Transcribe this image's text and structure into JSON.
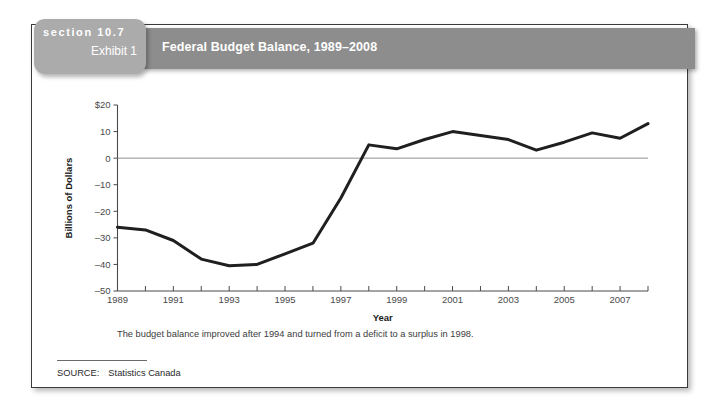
{
  "card": {
    "section_label": "section 10.7",
    "exhibit_label": "Exhibit 1",
    "banner_title": "Federal Budget Balance, 1989–2008",
    "caption": "The budget balance improved after 1994 and turned from a deficit to a surplus in 1998.",
    "source_label": "SOURCE:",
    "source_value": "Statistics Canada"
  },
  "colors": {
    "banner": "#8d8d8d",
    "section_tab": "#ababab",
    "line": "#1f1f1f",
    "axis": "#4a4a4a",
    "zero_line": "#8f8f8f",
    "card_border": "#3a3a3a"
  },
  "chart_data": {
    "type": "line",
    "title": "Federal Budget Balance, 1989–2008",
    "xlabel": "Year",
    "ylabel": "Billions of Dollars",
    "xlim": [
      1989,
      2008
    ],
    "ylim": [
      -50,
      20
    ],
    "ytick_values": [
      20,
      10,
      0,
      -10,
      -20,
      -30,
      -40,
      -50
    ],
    "ytick_labels": [
      "$20",
      "10",
      "0",
      "–10",
      "–20",
      "–30",
      "–40",
      "–50"
    ],
    "xtick_values": [
      1989,
      1990,
      1991,
      1992,
      1993,
      1994,
      1995,
      1996,
      1997,
      1998,
      1999,
      2000,
      2001,
      2002,
      2003,
      2004,
      2005,
      2006,
      2007,
      2008
    ],
    "xtick_labels": [
      "1989",
      "",
      "1991",
      "",
      "1993",
      "",
      "1995",
      "",
      "1997",
      "",
      "1999",
      "",
      "2001",
      "",
      "2003",
      "",
      "2005",
      "",
      "2007",
      ""
    ],
    "grid": false,
    "legend": "none",
    "zero_reference_line": 0,
    "series": [
      {
        "name": "Federal Budget Balance",
        "x": [
          1989,
          1990,
          1991,
          1992,
          1993,
          1994,
          1995,
          1996,
          1997,
          1998,
          1999,
          2000,
          2001,
          2002,
          2003,
          2004,
          2005,
          2006,
          2007,
          2008
        ],
        "values": [
          -26,
          -27,
          -31,
          -38,
          -40.5,
          -40,
          -36,
          -32,
          -15,
          5,
          3.5,
          7,
          10,
          8.5,
          7,
          3,
          6,
          9.5,
          7.5,
          13
        ]
      }
    ]
  }
}
